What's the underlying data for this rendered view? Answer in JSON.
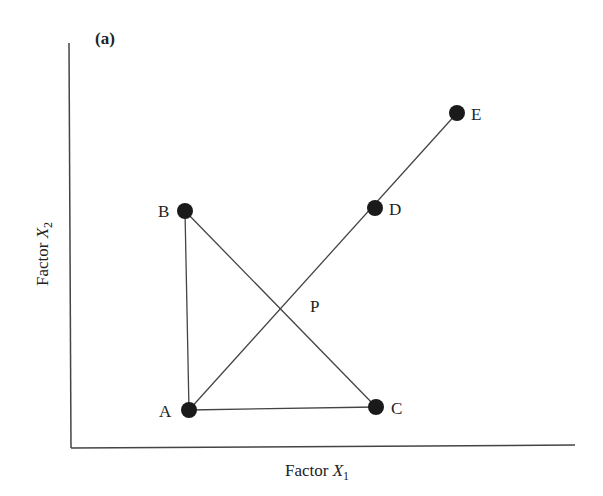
{
  "panel_label": "(a)",
  "axes": {
    "x_label_prefix": "Factor ",
    "x_label_var": "X",
    "x_label_sub": "1",
    "y_label_prefix": "Factor ",
    "y_label_var": "X",
    "y_label_sub": "2"
  },
  "points": [
    {
      "id": "A",
      "label": "A",
      "x": 189,
      "y": 410
    },
    {
      "id": "B",
      "label": "B",
      "x": 185,
      "y": 211
    },
    {
      "id": "C",
      "label": "C",
      "x": 376,
      "y": 407
    },
    {
      "id": "D",
      "label": "D",
      "x": 375,
      "y": 208
    },
    {
      "id": "E",
      "label": "E",
      "x": 457,
      "y": 113
    }
  ],
  "intersection": {
    "label": "P"
  },
  "segments": [
    [
      "A",
      "B"
    ],
    [
      "A",
      "C"
    ],
    [
      "B",
      "C"
    ],
    [
      "A",
      "E"
    ]
  ],
  "colors": {
    "ink": "#222222",
    "line": "#444444",
    "background": "#ffffff"
  }
}
